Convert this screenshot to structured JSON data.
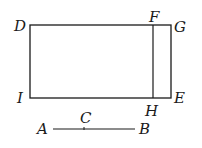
{
  "diagram": {
    "colors": {
      "stroke": "#1a1a1a",
      "background": "#ffffff"
    },
    "points": {
      "D": {
        "label": "D",
        "x": 30,
        "y": 25
      },
      "F": {
        "label": "F",
        "x": 153,
        "y": 25
      },
      "G": {
        "label": "G",
        "x": 171,
        "y": 25
      },
      "I": {
        "label": "I",
        "x": 30,
        "y": 98
      },
      "H": {
        "label": "H",
        "x": 153,
        "y": 98
      },
      "E": {
        "label": "E",
        "x": 171,
        "y": 98
      },
      "A": {
        "label": "A",
        "x": 53,
        "y": 129
      },
      "C": {
        "label": "C",
        "x": 84,
        "y": 129
      },
      "B": {
        "label": "B",
        "x": 135,
        "y": 129
      }
    },
    "shapes": {
      "rectangle_DGEI": "DGEI",
      "divider_FH": "FH",
      "segment_AB": "AB"
    }
  }
}
